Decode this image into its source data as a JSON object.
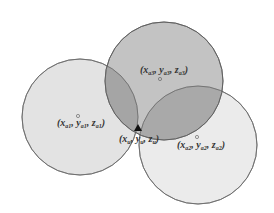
{
  "diagram": {
    "type": "trilateration",
    "circles": [
      {
        "id": "a1",
        "cx": 80,
        "cy": 117,
        "r": 58,
        "fill": "#e4e4e4"
      },
      {
        "id": "a3",
        "cx": 164,
        "cy": 81,
        "r": 59,
        "fill": "#a9a9a9"
      },
      {
        "id": "a2",
        "cx": 198,
        "cy": 145,
        "r": 59,
        "fill": "#ececec"
      }
    ],
    "labels": {
      "a3": {
        "x_base": "x",
        "x_sub": "a3",
        "y_base": "y",
        "y_sub": "a3",
        "z_base": "z",
        "z_sub": "a3"
      },
      "a1": {
        "x_base": "x",
        "x_sub": "a1",
        "y_base": "y",
        "y_sub": "a1",
        "z_base": "z",
        "z_sub": "a1"
      },
      "a2": {
        "x_base": "x",
        "x_sub": "a2",
        "y_base": "y",
        "y_sub": "a2",
        "z_base": "z",
        "z_sub": "a2"
      },
      "u": {
        "x_base": "x",
        "x_sub": "u",
        "y_base": "y",
        "y_sub": "u",
        "z_base": "z",
        "z_sub": "u"
      }
    },
    "punct": {
      "open": "(",
      "comma": ", ",
      "close": ")"
    }
  }
}
